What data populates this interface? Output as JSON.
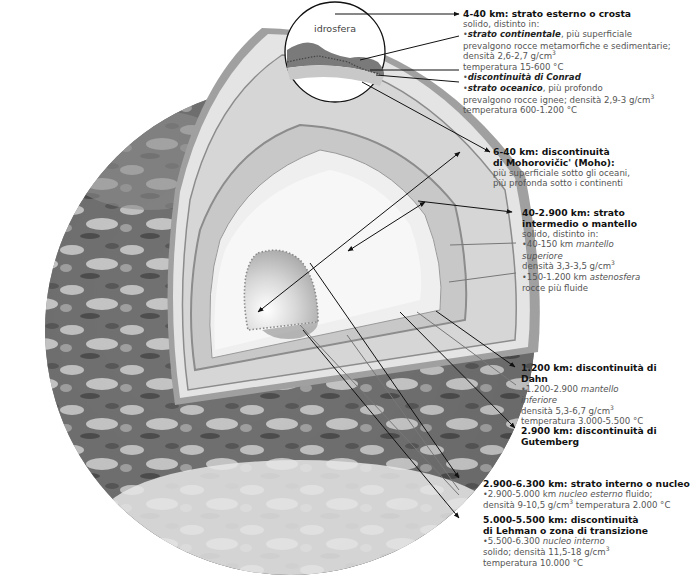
{
  "diagram": {
    "type": "earth-cutaway-cross-section",
    "language": "it",
    "colors": {
      "background": "#ffffff",
      "crust_band": "#9c9c9c",
      "mantle_upper": "#dcdcdc",
      "mantle_band": "#c4c4c4",
      "mantle_lower": "#eeeeee",
      "outer_core": "#f6f6f6",
      "inner_core": "#bdbdbd",
      "leader_line": "#111111",
      "title_text": "#111111",
      "body_text": "#555555"
    },
    "inset_label": "idrosfera",
    "labels": {
      "crust": {
        "title": "4-40 km: strato esterno o crosta",
        "intro": "solido, distinto in:",
        "continental_name": "strato continentale",
        "continental_rest": ", più superficiale",
        "continental_l2": "prevalgono rocce metamorfiche e sedimentarie;",
        "continental_l3": "densità 2,6-2,7 g/cm",
        "continental_l3_sup": "3",
        "continental_l4": "temperatura 15-600 °C",
        "conrad": "discontinuità di Conrad",
        "oceanic_name": "strato oceanico",
        "oceanic_rest": ", più profondo",
        "oceanic_l2": "prevalgono rocce ignee; densità 2,9-3 g/cm",
        "oceanic_l2_sup": "3",
        "oceanic_l3": "temperatura 600-1.200 °C"
      },
      "moho": {
        "title_l1": "6-40 km: discontinuità",
        "title_l2": "di Mohorovičic' (Moho):",
        "l1": "più superficiale sotto gli oceani,",
        "l2": "più profonda sotto i continenti"
      },
      "mantle": {
        "title_l1": "40-2.900 km: strato",
        "title_l2": "intermedio o mantello",
        "intro": "solido, distinto in:",
        "upper_pre": "40-150 km ",
        "upper_name_l1": "mantello",
        "upper_name_l2": "superiore",
        "upper_density": "densità 3,3-3,5 g/cm",
        "upper_density_sup": "3",
        "astheno_pre": "150-1.200 km ",
        "astheno_name": "astenosfera",
        "astheno_l2": "rocce più fluide"
      },
      "dahn": {
        "title_l1": "1.200 km: discontinuità di",
        "title_l2": "Dahn",
        "lower_pre": "1.200-2.900 ",
        "lower_name_l1": "mantello",
        "lower_name_l2": "inferiore",
        "density": "densità 5,3-6,7 g/cm",
        "density_sup": "3",
        "temperature": "temperatura 3.000-5.500 °C"
      },
      "gutenberg": {
        "title_l1": "2.900 km: discontinuità di",
        "title_l2": "Gutemberg"
      },
      "core": {
        "title": "2.900-6.300 km: strato interno o nucleo",
        "outer_pre": "2.900-5.000 km ",
        "outer_name": "nucleo esterno",
        "outer_rest": " fluido;",
        "outer_l2": "densità 9-10,5  g/cm",
        "outer_l2_sup": "3",
        "outer_l2_rest": " temperatura 2.000 °C"
      },
      "lehman": {
        "title_l1": "5.000-5.500 km: discontinuità",
        "title_l2": "di Lehman o zona di transizione",
        "inner_pre": "5.500-6.300 ",
        "inner_name": "nucleo interno",
        "inner_l2": "solido; densità 11,5-18  g/cm",
        "inner_l2_sup": "3",
        "inner_l3": "temperatura 10.000 °C"
      }
    }
  }
}
